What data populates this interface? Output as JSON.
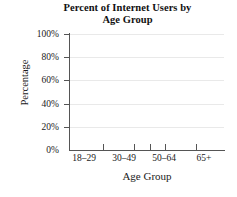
{
  "chart_data": {
    "type": "bar",
    "title": "Percent of Internet Users by Age Group",
    "title_lines": [
      "Percent of Internet Users by",
      "Age Group"
    ],
    "xlabel": "Age Group",
    "ylabel": "Percentage",
    "categories": [
      "18–29",
      "30–49",
      "50–64",
      "65+"
    ],
    "values": [
      null,
      null,
      null,
      null
    ],
    "series": [
      {
        "name": "Percentage",
        "values": [
          null,
          null,
          null,
          null
        ]
      }
    ],
    "ylim": [
      0,
      100
    ],
    "y_ticks": [
      0,
      20,
      40,
      60,
      80,
      100
    ],
    "y_tick_labels": [
      "0%",
      "20%",
      "40%",
      "60%",
      "80%",
      "100%"
    ],
    "x_tick_labels": [
      "18–29",
      "30–49",
      "50–64",
      "65+"
    ],
    "grid": true,
    "grid_axis": "y",
    "legend": false,
    "legend_position": "none",
    "data_plotted": false,
    "note": "Blank chart template — axes and labels only, no bars drawn",
    "colors": {
      "background": "#ffffff",
      "axis": "#555555",
      "gridline": "#e9e9e9",
      "text": "#1a1a1a"
    }
  }
}
